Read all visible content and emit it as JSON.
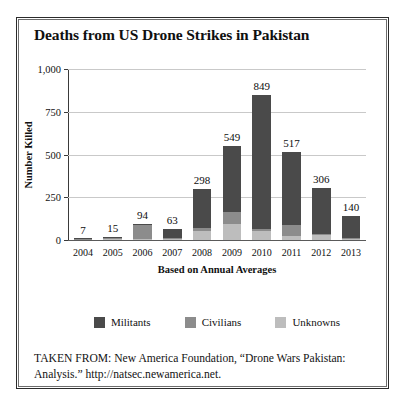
{
  "figure": {
    "title": "Deaths from US Drone Strikes in Pakistan",
    "source_note": "TAKEN FROM: New America Foundation, “Drone Wars Pakistan: Analysis.” http://natsec.newamerica.net."
  },
  "chart_data": {
    "type": "bar",
    "title": "Deaths from US Drone Strikes in Pakistan",
    "subtitle": "",
    "xlabel": "Based on Annual Averages",
    "ylabel": "Number Killed",
    "stacked": true,
    "grid": true,
    "legend_position": "bottom",
    "ylim": [
      0,
      1000
    ],
    "yticks": [
      0,
      250,
      500,
      750,
      1000
    ],
    "ytick_labels": [
      "0",
      "250",
      "500",
      "750",
      "1,000"
    ],
    "categories": [
      "2004",
      "2005",
      "2006",
      "2007",
      "2008",
      "2009",
      "2010",
      "2011",
      "2012",
      "2013"
    ],
    "series": [
      {
        "name": "Unknowns",
        "color": "#bdbdbd",
        "values": [
          0,
          2,
          6,
          4,
          50,
          95,
          50,
          25,
          28,
          6
        ]
      },
      {
        "name": "Civilians",
        "color": "#8c8c8c",
        "values": [
          2,
          5,
          80,
          6,
          18,
          70,
          14,
          65,
          10,
          6
        ]
      },
      {
        "name": "Militants",
        "color": "#4a4a4a",
        "values": [
          5,
          8,
          8,
          53,
          230,
          384,
          785,
          427,
          268,
          128
        ]
      }
    ],
    "totals": [
      7,
      15,
      94,
      63,
      298,
      549,
      849,
      517,
      306,
      140
    ],
    "total_labels": [
      "7",
      "15",
      "94",
      "63",
      "298",
      "549",
      "849",
      "517",
      "306",
      "140"
    ]
  },
  "legend": {
    "items": [
      {
        "label": "Militants",
        "color": "#4a4a4a"
      },
      {
        "label": "Civilians",
        "color": "#8c8c8c"
      },
      {
        "label": "Unknowns",
        "color": "#bdbdbd"
      }
    ]
  }
}
